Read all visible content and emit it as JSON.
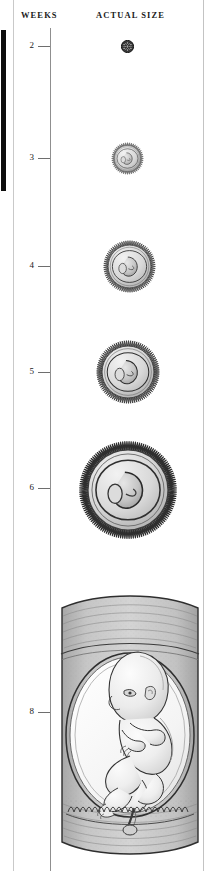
{
  "figure": {
    "width": 213,
    "height": 871,
    "background": "#ffffff"
  },
  "headers": {
    "weeks": "WEEKS",
    "actual_size": "ACTUAL SIZE"
  },
  "axis": {
    "line_color": "#8f8f8f",
    "tick_color": "#6e6e6e",
    "label_color": "#1a1a1a"
  },
  "stages": [
    {
      "week_label": "2",
      "label_y": 41,
      "tick_y": 46,
      "center_x": 127,
      "center_y": 46,
      "diameter": 13,
      "kind": "morula",
      "description": "dark textured cell cluster"
    },
    {
      "week_label": "3",
      "label_y": 153,
      "tick_y": 158,
      "center_x": 127,
      "center_y": 158,
      "diameter": 33,
      "kind": "villous-sac",
      "description": "chorionic villi ring with embryo"
    },
    {
      "week_label": "4",
      "label_y": 261,
      "tick_y": 266,
      "center_x": 129,
      "center_y": 266,
      "diameter": 53,
      "kind": "villous-sac",
      "description": "chorionic villi ring with curled embryo"
    },
    {
      "week_label": "5",
      "label_y": 367,
      "tick_y": 372,
      "center_x": 128,
      "center_y": 372,
      "diameter": 64,
      "kind": "villous-sac",
      "description": "chorionic villi ring with C-shaped embryo"
    },
    {
      "week_label": "6",
      "label_y": 483,
      "tick_y": 488,
      "center_x": 128,
      "center_y": 490,
      "diameter": 98,
      "kind": "villous-sac",
      "description": "chorionic villi ring with embryo and yolk sac"
    },
    {
      "week_label": "8",
      "label_y": 707,
      "tick_y": 712,
      "center_x": 130,
      "center_y": 712,
      "diameter": 0,
      "kind": "uterus-section",
      "description": "cross section of uterine wall with fetus in amniotic sac and umbilical cord"
    }
  ],
  "palette": {
    "ink": "#1a1a1a",
    "outline": "#3a3a3a",
    "mid_gray": "#9a9a9a",
    "light_gray": "#cfcfcf",
    "pale": "#e8e8e8",
    "tissue": "#b5b5b5",
    "paper": "#ffffff"
  },
  "edge_marks": {
    "black_bar": "#0d0d0d",
    "rule_left": "#c9c9c9",
    "rule_right": "#c3c3c3"
  }
}
